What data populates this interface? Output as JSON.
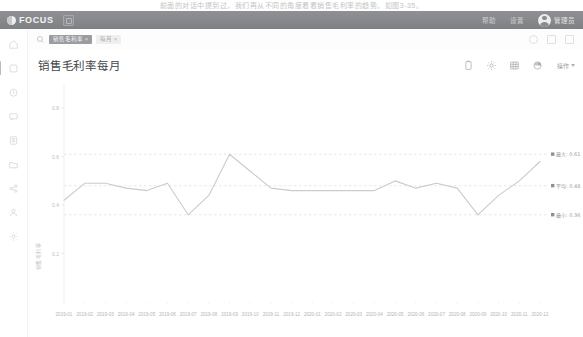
{
  "scan": {
    "top_text": "前面的对话中提到过，我们再从不同的角度看看销售毛利率的趋势。如图3-35。"
  },
  "appbar": {
    "brand": "FOCUS",
    "chip_icon": "app-grid-icon",
    "links": [
      "帮助",
      "设置"
    ],
    "user": "管理员"
  },
  "rail": {
    "items": [
      {
        "name": "home",
        "label": "首页",
        "icon": "home-icon",
        "active": false
      },
      {
        "name": "search",
        "label": "搜索",
        "icon": "search-icon",
        "active": true
      },
      {
        "name": "history",
        "label": "历史",
        "icon": "clock-icon",
        "active": false
      },
      {
        "name": "message",
        "label": "消息",
        "icon": "chat-icon",
        "active": false
      },
      {
        "name": "list",
        "label": "列表",
        "icon": "list-icon",
        "active": false
      },
      {
        "name": "folder",
        "label": "文件夹",
        "icon": "folder-icon",
        "active": false
      },
      {
        "name": "share",
        "label": "共享",
        "icon": "share-icon",
        "active": false
      },
      {
        "name": "user",
        "label": "用户",
        "icon": "user-icon",
        "active": false
      },
      {
        "name": "settings",
        "label": "设置",
        "icon": "gear-icon",
        "active": false
      }
    ]
  },
  "search": {
    "icon": "search-icon",
    "tags": [
      {
        "text": "销售毛利率",
        "type": "primary",
        "removable": true
      },
      {
        "text": "每月",
        "type": "plain",
        "removable": true
      }
    ],
    "actions": [
      "history-icon",
      "bookmark-icon",
      "more-icon"
    ]
  },
  "card": {
    "title": "销售毛利率每月",
    "tools": [
      {
        "name": "copy-button",
        "icon": "clipboard-icon"
      },
      {
        "name": "settings-button",
        "icon": "gear-icon"
      },
      {
        "name": "table-view-button",
        "icon": "table-icon"
      },
      {
        "name": "chart-type-button",
        "icon": "pie-chart-icon"
      }
    ],
    "operations_label": "操作"
  },
  "chart_data": {
    "type": "line",
    "title": "销售毛利率每月",
    "xlabel": "订单日期(按月)",
    "ylabel": "销售毛利率",
    "ylim": [
      0,
      0.9
    ],
    "yticks": [
      0.2,
      0.4,
      0.6,
      0.8
    ],
    "ytick_labels": [
      "0.2",
      "0.4",
      "0.6",
      "0.8"
    ],
    "grid": false,
    "legend": "none",
    "line_color": "#c9cbcd",
    "categories": [
      "2019-01",
      "2019-02",
      "2019-03",
      "2019-04",
      "2019-05",
      "2019-06",
      "2019-07",
      "2019-08",
      "2019-09",
      "2019-10",
      "2019-11",
      "2019-12",
      "2020-01",
      "2020-02",
      "2020-03",
      "2020-04",
      "2020-05",
      "2020-06",
      "2020-07",
      "2020-08",
      "2020-09",
      "2020-10",
      "2020-11",
      "2020-12"
    ],
    "values": [
      0.42,
      0.49,
      0.49,
      0.47,
      0.46,
      0.49,
      0.36,
      0.44,
      0.61,
      0.54,
      0.47,
      0.46,
      0.46,
      0.46,
      0.46,
      0.46,
      0.5,
      0.47,
      0.49,
      0.47,
      0.36,
      0.44,
      0.5,
      0.58
    ],
    "reference_lines": [
      {
        "name": "max",
        "label": "最大: 0.61",
        "value": 0.61,
        "style": "dashed"
      },
      {
        "name": "avg",
        "label": "平均: 0.48",
        "value": 0.48,
        "style": "dashed"
      },
      {
        "name": "min",
        "label": "最小: 0.36",
        "value": 0.36,
        "style": "dashed"
      }
    ]
  }
}
